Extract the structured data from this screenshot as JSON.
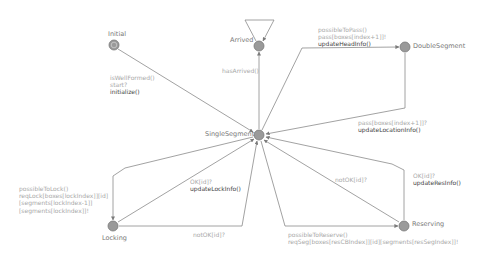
{
  "colors": {
    "edge": "#8a8a8a",
    "node_fill": "#9a9a9a",
    "node_stroke": "#7a7a7a",
    "location_name": "#777777",
    "guard_text": "#a8a8a8",
    "update_text": "#444444"
  },
  "locations": {
    "initial": {
      "name": "Initial",
      "x": 114,
      "y": 45,
      "is_initial": true
    },
    "arrived": {
      "name": "Arrived",
      "x": 259,
      "y": 46
    },
    "double_segment": {
      "name": "DoubleSegment",
      "x": 405,
      "y": 47
    },
    "single_segment": {
      "name": "SingleSegment",
      "x": 259,
      "y": 135
    },
    "locking": {
      "name": "Locking",
      "x": 113,
      "y": 226
    },
    "reserving": {
      "name": "Reserving",
      "x": 404,
      "y": 226
    }
  },
  "edges": [
    {
      "id": "initial-to-single",
      "lines": [
        "isWellFormed()",
        "start?",
        "initialize()"
      ]
    },
    {
      "id": "single-to-arrived",
      "lines": [
        "hasArrived()"
      ]
    },
    {
      "id": "arrived-self-loop",
      "lines": []
    },
    {
      "id": "single-to-double",
      "lines": [
        "possibleToPass()",
        "pass[boxes[index+1]]!",
        "updateHeadInfo()"
      ]
    },
    {
      "id": "double-to-single",
      "lines": [
        "pass[boxes[index+1]]?",
        "updateLocationInfo()"
      ]
    },
    {
      "id": "single-to-locking",
      "lines": [
        "possibleToLock()",
        "reqLock[boxes[lockIndex]][id]",
        "[segments[lockIndex-1]]",
        "[segments[lockIndex]]!"
      ]
    },
    {
      "id": "locking-to-single-ok",
      "lines": [
        "OK[id]?",
        "updateLockInfo()"
      ]
    },
    {
      "id": "locking-to-single-notok",
      "lines": [
        "notOK[id]?"
      ]
    },
    {
      "id": "single-to-reserving",
      "lines": [
        "possibleToReserve()",
        "reqSeg[boxes[resCBIndex]][id][segments[resSegIndex]]!"
      ]
    },
    {
      "id": "reserving-to-single-ok",
      "lines": [
        "OK[id]?",
        "updateResInfo()"
      ]
    },
    {
      "id": "reserving-to-single-notok",
      "lines": [
        "notOK[id]?"
      ]
    }
  ]
}
